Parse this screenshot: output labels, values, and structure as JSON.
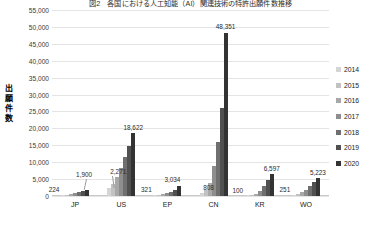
{
  "chart_data": {
    "type": "bar",
    "title": "図2　各国における人工知能（AI）関連技術の特許出願件数推移",
    "xlabel": "",
    "ylabel": "出願件数",
    "ylabel_chars": [
      "出",
      "願",
      "件",
      "数"
    ],
    "categories": [
      "JP",
      "US",
      "EP",
      "CN",
      "KR",
      "WO"
    ],
    "ylim": [
      0,
      55000
    ],
    "yticks": [
      0,
      5000,
      10000,
      15000,
      20000,
      25000,
      30000,
      35000,
      40000,
      45000,
      50000,
      55000
    ],
    "ytick_labels": [
      "0",
      "5,000",
      "10,000",
      "15,000",
      "20,000",
      "25,000",
      "30,000",
      "35,000",
      "40,000",
      "45,000",
      "50,000",
      "55,000"
    ],
    "grid": true,
    "legend_position": "right",
    "series": [
      {
        "name": "2014",
        "color": "#d5d5d5",
        "values": [
          224,
          2271,
          321,
          808,
          100,
          251
        ]
      },
      {
        "name": "2015",
        "color": "#c2c2c2",
        "values": [
          330,
          3600,
          430,
          1700,
          280,
          560
        ]
      },
      {
        "name": "2016",
        "color": "#a8a8a8",
        "values": [
          520,
          5600,
          610,
          3900,
          680,
          1100
        ]
      },
      {
        "name": "2017",
        "color": "#8e8e8e",
        "values": [
          760,
          8200,
          900,
          9000,
          1500,
          1900
        ]
      },
      {
        "name": "2018",
        "color": "#6f6f6f",
        "values": [
          1050,
          11600,
          1300,
          16000,
          2900,
          2900
        ]
      },
      {
        "name": "2019",
        "color": "#505050",
        "values": [
          1450,
          14900,
          1900,
          26000,
          4600,
          4000
        ]
      },
      {
        "name": "2020",
        "color": "#333333",
        "values": [
          1900,
          18622,
          3034,
          48351,
          6597,
          5223
        ]
      }
    ],
    "data_labels": [
      {
        "text": "224",
        "group": "JP",
        "series": "2014"
      },
      {
        "text": "1,900",
        "group": "JP",
        "series": "2020"
      },
      {
        "text": "2,271",
        "group": "US",
        "series": "2014"
      },
      {
        "text": "18,622",
        "group": "US",
        "series": "2020"
      },
      {
        "text": "321",
        "group": "EP",
        "series": "2014"
      },
      {
        "text": "3,034",
        "group": "EP",
        "series": "2020"
      },
      {
        "text": "808",
        "group": "CN",
        "series": "2014"
      },
      {
        "text": "48,351",
        "group": "CN",
        "series": "2020"
      },
      {
        "text": "100",
        "group": "KR",
        "series": "2014"
      },
      {
        "text": "6,597",
        "group": "KR",
        "series": "2020"
      },
      {
        "text": "251",
        "group": "WO",
        "series": "2014"
      },
      {
        "text": "5,223",
        "group": "WO",
        "series": "2020"
      }
    ]
  },
  "colors": {
    "grid": "#e4e4e4",
    "axis": "#c9c9c9",
    "text": "#222222",
    "background": "#ffffff"
  }
}
